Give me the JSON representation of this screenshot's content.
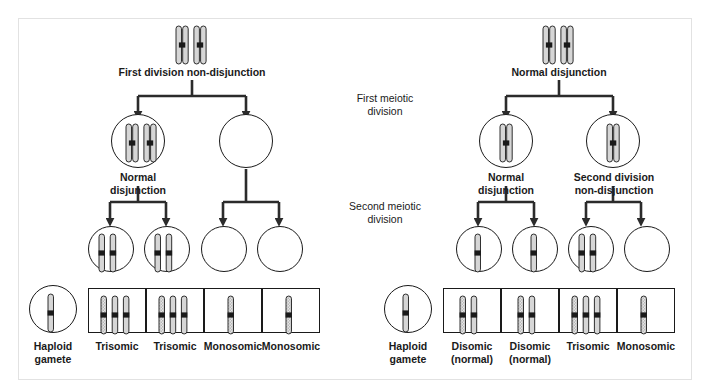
{
  "figure": {
    "bg": "#ffffff",
    "stroke": "#1a1a1a",
    "panel_border": "#e2e2e2"
  },
  "center_labels": [
    {
      "text": "First meiotic\ndivision",
      "x": 336,
      "y": 92,
      "w": 98
    },
    {
      "text": "Second meiotic\ndivision",
      "x": 331,
      "y": 200,
      "w": 108
    }
  ],
  "left": {
    "top_label": "First division non-disjunction",
    "stage1_label": "Normal\ndisjunction",
    "parent_cell": {
      "chromosomes": 2,
      "type": "duplicated"
    },
    "meiosis1_cells": [
      {
        "id": "L1A",
        "chromosomes": 2,
        "type": "duplicated",
        "label": "Normal\ndisjunction"
      },
      {
        "id": "L1B",
        "chromosomes": 0,
        "type": "empty",
        "label": ""
      }
    ],
    "meiosis2_cells": [
      {
        "id": "L2A",
        "chromosomes": 2,
        "type": "duplicated"
      },
      {
        "id": "L2B",
        "chromosomes": 2,
        "type": "duplicated"
      },
      {
        "id": "L2C",
        "chromosomes": 0,
        "type": "empty"
      },
      {
        "id": "L2D",
        "chromosomes": 0,
        "type": "empty"
      }
    ],
    "haploid_gamete": {
      "label": "Haploid\ngamete",
      "chromosomes": 1
    },
    "zygote_boxes": [
      {
        "label": "Trisomic",
        "chromosomes": 3
      },
      {
        "label": "Trisomic",
        "chromosomes": 3
      },
      {
        "label": "Monosomic",
        "chromosomes": 1
      },
      {
        "label": "Monosomic",
        "chromosomes": 1
      }
    ]
  },
  "right": {
    "top_label": "Normal disjunction",
    "parent_cell": {
      "chromosomes": 2,
      "type": "duplicated"
    },
    "meiosis1_cells": [
      {
        "id": "R1A",
        "chromosomes": 1,
        "type": "duplicated",
        "label": "Normal\ndisjunction"
      },
      {
        "id": "R1B",
        "chromosomes": 1,
        "type": "duplicated",
        "label": "Second division\nnon-disjunction"
      }
    ],
    "meiosis2_cells": [
      {
        "id": "R2A",
        "chromosomes": 1,
        "type": "single"
      },
      {
        "id": "R2B",
        "chromosomes": 1,
        "type": "single"
      },
      {
        "id": "R2C",
        "chromosomes": 2,
        "type": "single"
      },
      {
        "id": "R2D",
        "chromosomes": 0,
        "type": "empty"
      }
    ],
    "haploid_gamete": {
      "label": "Haploid\ngamete",
      "chromosomes": 1
    },
    "zygote_boxes": [
      {
        "label": "Disomic\n(normal)",
        "chromosomes": 2
      },
      {
        "label": "Disomic\n(normal)",
        "chromosomes": 2
      },
      {
        "label": "Trisomic",
        "chromosomes": 3
      },
      {
        "label": "Monosomic",
        "chromosomes": 1
      }
    ]
  }
}
